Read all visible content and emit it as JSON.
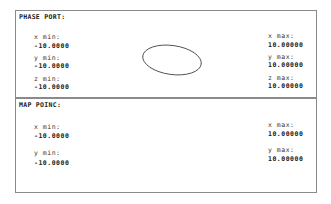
{
  "phase_port": {
    "title": "PHASE PORT:",
    "x_min_label": "x min:",
    "x_min": "-10.0000",
    "y_min_label": "y min:",
    "y_min": "-10.0000",
    "z_min_label": "z min:",
    "z_min": "-10.0000",
    "x_max_label": "x max:",
    "x_max": "10.00000",
    "y_max_label": "y max:",
    "y_max": "10.00000",
    "z_max_label": "z max:",
    "z_max": "10.00000"
  },
  "map_poinc": {
    "title": "MAP POINC:",
    "x_min_label": "x min:",
    "x_min": "-10.0000",
    "y_min_label": "y min:",
    "y_min": "-10.0000",
    "x_max_label": "x max:",
    "x_max": "10.00000",
    "y_max_label": "y max:",
    "y_max": "10.00000"
  }
}
